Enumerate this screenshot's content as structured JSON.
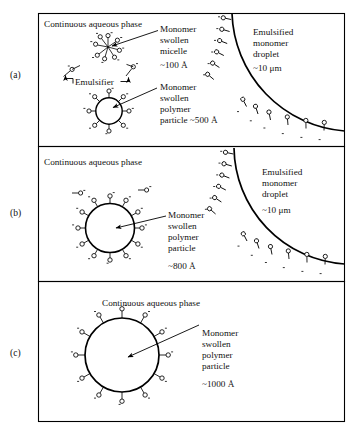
{
  "figure": {
    "background_color": "#ffffff",
    "ink_color": "#000000",
    "width": 353,
    "height": 435
  },
  "panels": [
    {
      "id": "a",
      "label": "(a)",
      "phase_label": "Continuous aqueous phase",
      "annotations": [
        {
          "name": "micelle",
          "lines": [
            "Monomer",
            "swollen",
            "micelle"
          ],
          "size": "~100 Å"
        },
        {
          "name": "emulsifier",
          "lines": [
            "Emulsifier"
          ],
          "size": ""
        },
        {
          "name": "polymer-particle",
          "lines": [
            "Monomer",
            "swollen",
            "polymer"
          ],
          "size": "particle ~500 Å"
        },
        {
          "name": "droplet",
          "lines": [
            "Emulsified",
            "monomer",
            "droplet"
          ],
          "size": "~10 μm"
        }
      ]
    },
    {
      "id": "b",
      "label": "(b)",
      "phase_label": "Continuous aqueous phase",
      "annotations": [
        {
          "name": "polymer-particle",
          "lines": [
            "Monomer",
            "swollen",
            "polymer",
            "particle"
          ],
          "size": "~800 Å"
        },
        {
          "name": "droplet",
          "lines": [
            "Emulsified",
            "monomer",
            "droplet"
          ],
          "size": "~10 μm"
        }
      ]
    },
    {
      "id": "c",
      "label": "(c)",
      "phase_label": "Continuous aqueous phase",
      "annotations": [
        {
          "name": "polymer-particle",
          "lines": [
            "Monomer",
            "swollen",
            "polymer",
            "particle"
          ],
          "size": "~1000 Å"
        }
      ]
    }
  ],
  "text": {
    "continuous_aqueous_phase": "Continuous aqueous phase",
    "monomer": "Monomer",
    "swollen": "swollen",
    "micelle": "micelle",
    "polymer": "polymer",
    "particle": "particle",
    "emulsifier": "Emulsifier",
    "emulsified": "Emulsified",
    "monomer_lower": "monomer",
    "droplet": "droplet",
    "size_100a": "~100 Å",
    "size_500a": "particle ~500 Å",
    "size_800a": "~800 Å",
    "size_1000a": "~1000 Å",
    "size_10um": "~10 μm",
    "label_a": "(a)",
    "label_b": "(b)",
    "label_c": "(c)"
  }
}
